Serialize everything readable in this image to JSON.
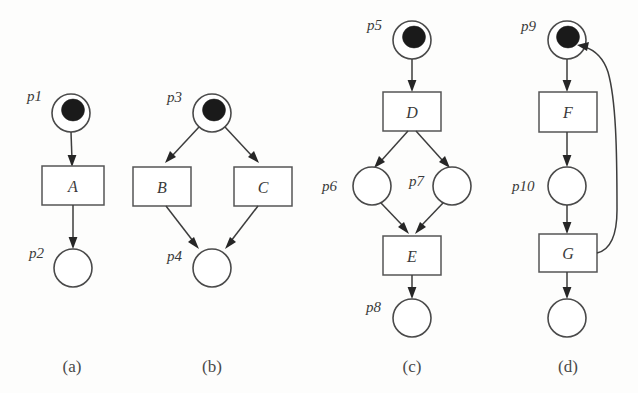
{
  "figure": {
    "type": "petri-net",
    "subfigures": [
      {
        "caption": "(a)",
        "pattern": "sequence",
        "places": [
          {
            "id": "p1",
            "label": "p1",
            "tokens": 1,
            "cx": 71,
            "cy": 113,
            "r": 19,
            "label_x": 27,
            "label_y": 101
          },
          {
            "id": "p2",
            "label": "p2",
            "tokens": 0,
            "cx": 73,
            "cy": 268,
            "r": 19,
            "label_x": 29,
            "label_y": 258
          }
        ],
        "transitions": [
          {
            "id": "A",
            "label": "A",
            "x": 42,
            "y": 166,
            "w": 62,
            "h": 39
          }
        ],
        "arcs": [
          {
            "from": "p1",
            "to": "A"
          },
          {
            "from": "A",
            "to": "p2"
          }
        ],
        "caption_x": 72,
        "caption_y": 372
      },
      {
        "caption": "(b)",
        "pattern": "and-split-and-join",
        "places": [
          {
            "id": "p3",
            "label": "p3",
            "tokens": 1,
            "cx": 212,
            "cy": 113,
            "r": 19,
            "label_x": 167,
            "label_y": 102
          },
          {
            "id": "p4",
            "label": "p4",
            "tokens": 0,
            "cx": 212,
            "cy": 268,
            "r": 19,
            "label_x": 167,
            "label_y": 261
          }
        ],
        "transitions": [
          {
            "id": "B",
            "label": "B",
            "x": 133,
            "y": 167,
            "w": 58,
            "h": 39
          },
          {
            "id": "C",
            "label": "C",
            "x": 234,
            "y": 167,
            "w": 58,
            "h": 39
          }
        ],
        "arcs": [
          {
            "from": "p3",
            "to": "B"
          },
          {
            "from": "p3",
            "to": "C"
          },
          {
            "from": "B",
            "to": "p4"
          },
          {
            "from": "C",
            "to": "p4"
          }
        ],
        "caption_x": 212,
        "caption_y": 372
      },
      {
        "caption": "(c)",
        "pattern": "fork-join",
        "places": [
          {
            "id": "p5",
            "label": "p5",
            "tokens": 1,
            "cx": 412,
            "cy": 40,
            "r": 19,
            "label_x": 367,
            "label_y": 30
          },
          {
            "id": "p6",
            "label": "p6",
            "tokens": 0,
            "cx": 372,
            "cy": 186,
            "r": 19,
            "label_x": 322,
            "label_y": 191
          },
          {
            "id": "p7",
            "label": "p7",
            "tokens": 0,
            "cx": 452,
            "cy": 186,
            "r": 19,
            "label_x": 409,
            "label_y": 186
          },
          {
            "id": "p8",
            "label": "p8",
            "tokens": 0,
            "cx": 412,
            "cy": 318,
            "r": 19,
            "label_x": 366,
            "label_y": 312
          }
        ],
        "transitions": [
          {
            "id": "D",
            "label": "D",
            "x": 383,
            "y": 92,
            "w": 58,
            "h": 39
          },
          {
            "id": "E",
            "label": "E",
            "x": 383,
            "y": 236,
            "w": 58,
            "h": 39
          }
        ],
        "arcs": [
          {
            "from": "p5",
            "to": "D"
          },
          {
            "from": "D",
            "to": "p6"
          },
          {
            "from": "D",
            "to": "p7"
          },
          {
            "from": "p6",
            "to": "E"
          },
          {
            "from": "p7",
            "to": "E"
          },
          {
            "from": "E",
            "to": "p8"
          }
        ],
        "caption_x": 412,
        "caption_y": 372
      },
      {
        "caption": "(d)",
        "pattern": "loop",
        "places": [
          {
            "id": "p9",
            "label": "p9",
            "tokens": 1,
            "cx": 567,
            "cy": 40,
            "r": 19,
            "label_x": 521,
            "label_y": 31
          },
          {
            "id": "p10",
            "label": "p10",
            "tokens": 0,
            "cx": 567,
            "cy": 186,
            "r": 19,
            "label_x": 512,
            "label_y": 191
          },
          {
            "id": "p11",
            "label": "",
            "tokens": 0,
            "cx": 567,
            "cy": 318,
            "r": 19,
            "label_x": 0,
            "label_y": 0
          }
        ],
        "transitions": [
          {
            "id": "F",
            "label": "F",
            "x": 539,
            "y": 92,
            "w": 58,
            "h": 40
          },
          {
            "id": "G",
            "label": "G",
            "x": 539,
            "y": 234,
            "w": 58,
            "h": 38
          }
        ],
        "arcs": [
          {
            "from": "p9",
            "to": "F"
          },
          {
            "from": "F",
            "to": "p10"
          },
          {
            "from": "p10",
            "to": "G"
          },
          {
            "from": "G",
            "to": "p11"
          },
          {
            "from": "G",
            "to": "p9",
            "curved": true
          }
        ],
        "caption_x": 568,
        "caption_y": 372
      }
    ]
  }
}
